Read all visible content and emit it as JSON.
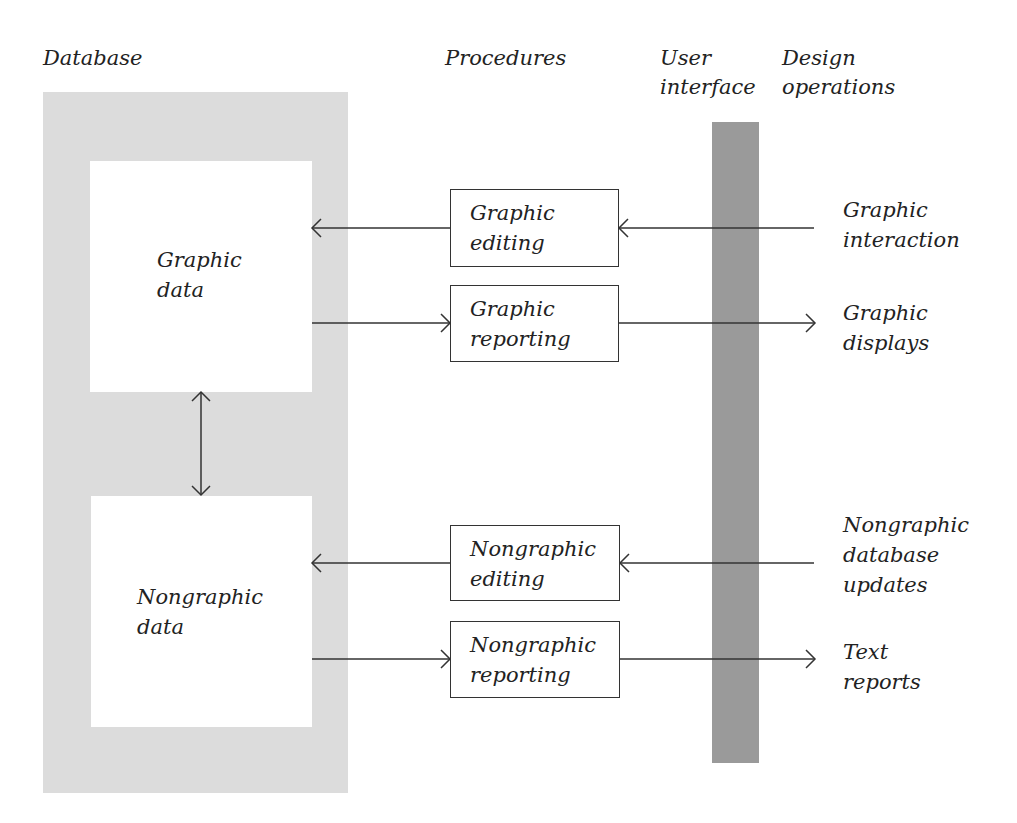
{
  "columns": {
    "database": "Database",
    "procedures": "Procedures",
    "user_interface": [
      "User",
      "interface"
    ],
    "design_operations": [
      "Design",
      "operations"
    ]
  },
  "stores": {
    "graphic": [
      "Graphic",
      "data"
    ],
    "nongraphic": [
      "Nongraphic",
      "data"
    ]
  },
  "procedures": {
    "graphic_editing": [
      "Graphic",
      "editing"
    ],
    "graphic_reporting": [
      "Graphic",
      "reporting"
    ],
    "nongraphic_editing": [
      "Nongraphic",
      "editing"
    ],
    "nongraphic_reporting": [
      "Nongraphic",
      "reporting"
    ]
  },
  "operations": {
    "graphic_interaction": [
      "Graphic",
      "interaction"
    ],
    "graphic_displays": [
      "Graphic",
      "displays"
    ],
    "nongraphic_updates": [
      "Nongraphic",
      "database",
      "updates"
    ],
    "text_reports": [
      "Text",
      "reports"
    ]
  },
  "colors": {
    "database_panel": "#dcdcdc",
    "user_interface_bar": "#9a9a9a",
    "line": "#333333"
  }
}
